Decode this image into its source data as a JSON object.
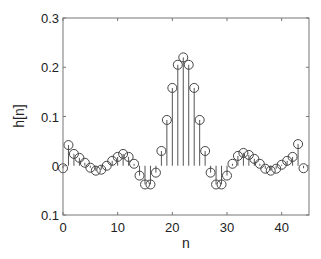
{
  "chart_data": {
    "type": "stem",
    "title": "",
    "xlabel": "n",
    "ylabel": "h[n]",
    "xlim": [
      0,
      45
    ],
    "ylim": [
      -0.1,
      0.3
    ],
    "xticks": [
      0,
      10,
      20,
      30,
      40
    ],
    "xtick_labels": [
      "0",
      "10",
      "20",
      "30",
      "40"
    ],
    "yticks": [
      0.3,
      0.2,
      0.1,
      0,
      -0.1
    ],
    "ytick_labels": [
      "0.3",
      "0.2",
      "0.1",
      "0",
      "0.1"
    ],
    "grid": false,
    "legend": null,
    "x": [
      0,
      1,
      2,
      3,
      4,
      5,
      6,
      7,
      8,
      9,
      10,
      11,
      12,
      13,
      14,
      15,
      16,
      17,
      18,
      19,
      20,
      21,
      22,
      23,
      24,
      25,
      26,
      27,
      28,
      29,
      30,
      31,
      32,
      33,
      34,
      35,
      36,
      37,
      38,
      39,
      40,
      41,
      42,
      43,
      44
    ],
    "values": [
      -0.005,
      0.042,
      0.024,
      0.016,
      0.006,
      -0.004,
      -0.01,
      -0.008,
      0.0,
      0.01,
      0.018,
      0.024,
      0.018,
      0.004,
      -0.02,
      -0.038,
      -0.038,
      -0.014,
      0.03,
      0.093,
      0.158,
      0.205,
      0.22,
      0.205,
      0.158,
      0.093,
      0.03,
      -0.014,
      -0.038,
      -0.038,
      -0.02,
      0.004,
      0.02,
      0.026,
      0.022,
      0.014,
      0.004,
      -0.006,
      -0.01,
      -0.006,
      0.002,
      0.01,
      0.018,
      0.044,
      -0.005
    ],
    "colors": {
      "stem": "#555555",
      "marker": "#444444",
      "axes": "#777777",
      "text": "#222222"
    }
  }
}
